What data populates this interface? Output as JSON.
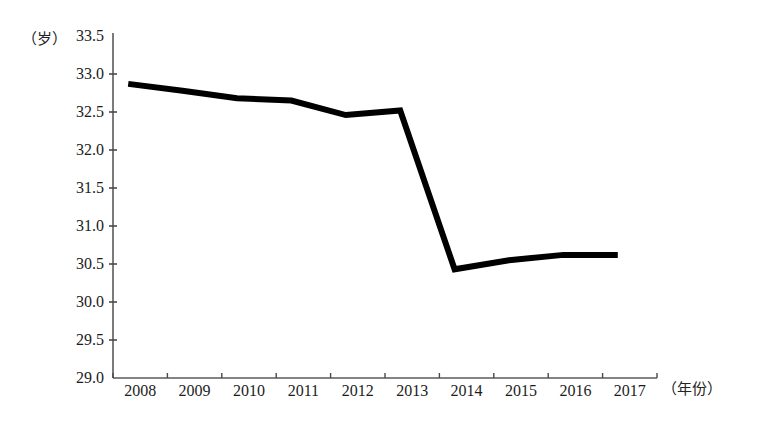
{
  "chart_data": {
    "type": "line",
    "title": "",
    "subtitle": "",
    "xlabel": "（年份）",
    "ylabel": "（岁）",
    "x": [
      2008,
      2009,
      2010,
      2011,
      2012,
      2013,
      2014,
      2015,
      2016,
      2017
    ],
    "categories": [
      "2008",
      "2009",
      "2010",
      "2011",
      "2012",
      "2013",
      "2014",
      "2015",
      "2016",
      "2017"
    ],
    "values": [
      32.87,
      32.78,
      32.68,
      32.65,
      32.46,
      32.52,
      30.43,
      30.55,
      30.62,
      30.62
    ],
    "series": [
      {
        "name": "",
        "values": [
          32.87,
          32.78,
          32.68,
          32.65,
          32.46,
          32.52,
          30.43,
          30.55,
          30.62,
          30.62
        ],
        "color": "#000000"
      }
    ],
    "ylim": [
      29.0,
      33.5
    ],
    "ytick_labels": [
      "33.5",
      "33.0",
      "32.5",
      "32.0",
      "31.5",
      "31.0",
      "30.5",
      "30.0",
      "29.5",
      "29.0"
    ],
    "ytick_values": [
      33.5,
      33.0,
      32.5,
      32.0,
      31.5,
      31.0,
      30.5,
      30.0,
      29.5,
      29.0
    ],
    "xtick_labels": [
      "2008",
      "2009",
      "2010",
      "2011",
      "2012",
      "2013",
      "2014",
      "2015",
      "2016",
      "2017"
    ],
    "grid": false,
    "legend": null,
    "line_color": "#000000",
    "line_width": 6,
    "axis_color": "#555555",
    "markers": false
  },
  "axes": {
    "y_unit_label": "（岁）",
    "x_unit_label": "（年份）"
  }
}
